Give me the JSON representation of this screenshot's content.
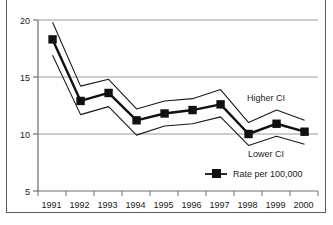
{
  "chart_data": {
    "type": "line",
    "title": "",
    "xlabel": "",
    "ylabel": "",
    "x": [
      1991,
      1992,
      1993,
      1994,
      1995,
      1996,
      1997,
      1998,
      1999,
      2000
    ],
    "categories": [
      "1991",
      "1992",
      "1993",
      "1994",
      "1995",
      "1996",
      "1997",
      "1998",
      "1999",
      "2000"
    ],
    "ylim": [
      5,
      20
    ],
    "yticks": [
      5,
      10,
      15,
      20
    ],
    "ytick_labels": [
      "5",
      "10",
      "15",
      "20"
    ],
    "grid": "horizontal gridlines at 10, 15, 20",
    "legend_position": "inside lower right",
    "series": [
      {
        "name": "Higher CI",
        "style": "thin line, no markers, upper confidence bound",
        "values": [
          19.8,
          14.2,
          14.8,
          12.2,
          12.9,
          13.1,
          13.9,
          11.0,
          12.1,
          11.2
        ]
      },
      {
        "name": "Rate per 100,000",
        "style": "bold line with filled square markers",
        "values": [
          18.3,
          12.9,
          13.6,
          11.2,
          11.8,
          12.1,
          12.6,
          10.0,
          10.9,
          10.2
        ]
      },
      {
        "name": "Lower CI",
        "style": "thin line, no markers, lower confidence bound",
        "values": [
          16.9,
          11.7,
          12.4,
          9.9,
          10.7,
          10.9,
          11.5,
          9.0,
          9.8,
          9.1
        ]
      }
    ],
    "annotations": [
      {
        "text": "Higher CI",
        "x": 1999,
        "y": 13.2
      },
      {
        "text": "Lower CI",
        "x": 1999,
        "y": 8.1
      }
    ],
    "legend": [
      {
        "label": "Rate per 100,000",
        "marker": "filled-square"
      }
    ]
  }
}
